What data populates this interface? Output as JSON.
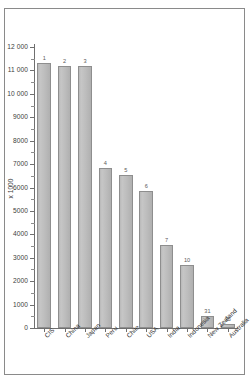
{
  "chart_data": {
    "type": "bar",
    "title": "",
    "subtitle": "",
    "xlabel": "",
    "ylabel": "x 1000",
    "ylim": [
      0,
      12000
    ],
    "grid": false,
    "legend": null,
    "categories": [
      "CIS",
      "China",
      "Japan",
      "Peru",
      "Chile",
      "USA",
      "India",
      "Indonesia",
      "New Zealand",
      "Australia"
    ],
    "values": [
      11300,
      11200,
      11200,
      6850,
      6550,
      5850,
      3550,
      2700,
      520,
      180
    ],
    "point_labels": [
      "1",
      "2",
      "3",
      "4",
      "5",
      "6",
      "7",
      "10",
      "31",
      "35"
    ],
    "point_label_note": "world rank annotated above each bar",
    "yticks_major": [
      0,
      1000,
      2000,
      3000,
      4000,
      5000,
      6000,
      7000,
      8000,
      9000,
      10000,
      11000,
      12000
    ],
    "ytick_labels": [
      "0",
      "1000",
      "2000",
      "3000",
      "4000",
      "5000",
      "6000",
      "7000",
      "8000",
      "9000",
      "10 000",
      "11 000",
      "12 000"
    ],
    "bar_fill_color": "#bdbdbd",
    "bar_edge_color": "#8e8e8e",
    "axis_color": "#6f6f6f",
    "background_color": "#ffffff"
  }
}
